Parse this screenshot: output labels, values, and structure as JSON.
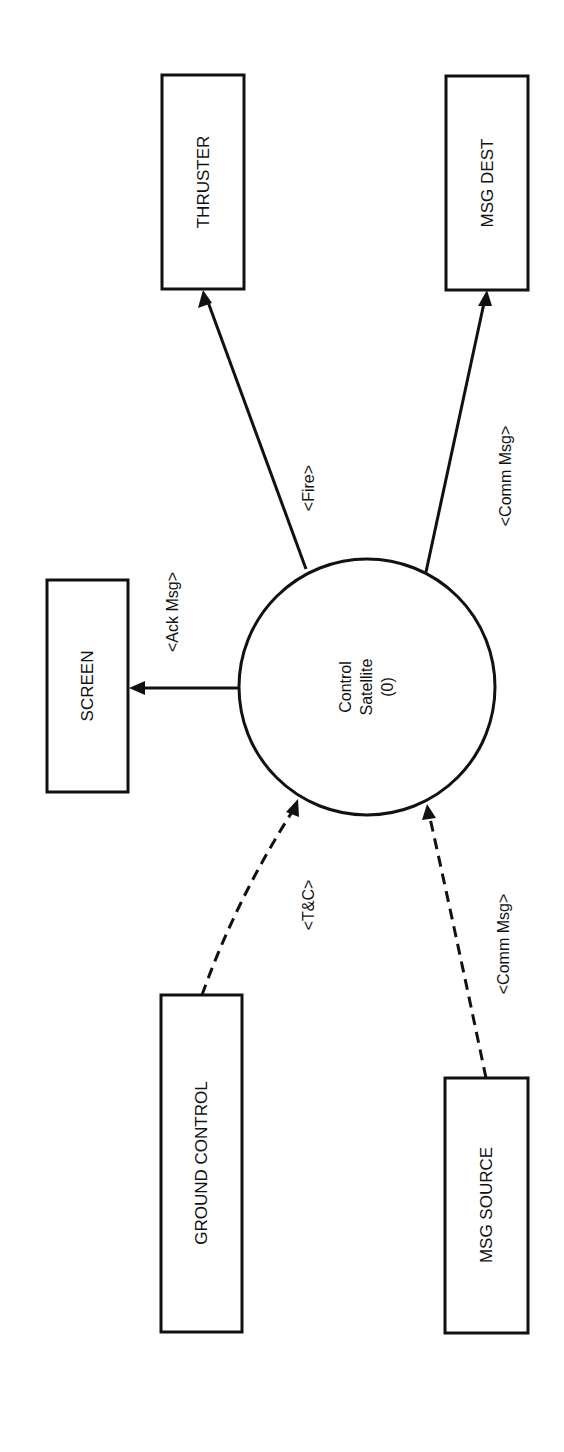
{
  "diagram": {
    "type": "context data flow diagram",
    "orientation": "rotated 90 degrees counter-clockwise",
    "process": {
      "line1": "Control",
      "line2": "Satellite",
      "line3": "(0)"
    },
    "entities": {
      "thruster": "THRUSTER",
      "msg_dest": "MSG DEST",
      "screen": "SCREEN",
      "ground_control": "GROUND CONTROL",
      "msg_source": "MSG SOURCE"
    },
    "flows": {
      "fire": "<Fire>",
      "comm_msg_out": "<Comm Msg>",
      "ack_msg": "<Ack Msg>",
      "t_and_c": "<T&C>",
      "comm_msg_in": "<Comm Msg>"
    },
    "flow_list": [
      {
        "from": "Control Satellite (0)",
        "to": "THRUSTER",
        "label": "<Fire>",
        "style": "solid"
      },
      {
        "from": "Control Satellite (0)",
        "to": "MSG DEST",
        "label": "<Comm Msg>",
        "style": "solid"
      },
      {
        "from": "Control Satellite (0)",
        "to": "SCREEN",
        "label": "<Ack Msg>",
        "style": "solid"
      },
      {
        "from": "GROUND CONTROL",
        "to": "Control Satellite (0)",
        "label": "<T&C>",
        "style": "dashed"
      },
      {
        "from": "MSG SOURCE",
        "to": "Control Satellite (0)",
        "label": "<Comm Msg>",
        "style": "dashed"
      }
    ],
    "colors": {
      "ink": "#111111",
      "background": "#ffffff"
    }
  }
}
